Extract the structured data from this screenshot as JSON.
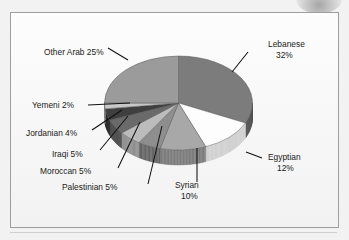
{
  "figure": {
    "frame_border_color": "#9e9e9e",
    "background_color": "#f2f2f2"
  },
  "chart_data": {
    "type": "pie",
    "title": "",
    "xlabel": "",
    "ylabel": "",
    "legend_position": "none",
    "labels_style": "callout-with-leader-lines",
    "three_d": true,
    "start_angle_deg": 0,
    "direction": "clockwise",
    "total_percent": 100,
    "categories": [
      "Lebanese",
      "Egyptian",
      "Syrian",
      "Palestinian",
      "Moroccan",
      "Iraqi",
      "Jordanian",
      "Yemeni",
      "Other Arab"
    ],
    "values": [
      32,
      12,
      10,
      5,
      5,
      5,
      4,
      2,
      25
    ],
    "slices": [
      {
        "name": "Lebanese",
        "value": 32,
        "label": "Lebanese",
        "value_label": "32%",
        "color": "#7c7c7c",
        "side_color": "#565656"
      },
      {
        "name": "Egyptian",
        "value": 12,
        "label": "Egyptian",
        "value_label": "12%",
        "color": "#fdfdfd",
        "side_color": "#d2d2d2"
      },
      {
        "name": "Syrian",
        "value": 10,
        "label": "Syrian",
        "value_label": "10%",
        "color": "#a8a8a8",
        "side_color": "#7e7e7e"
      },
      {
        "name": "Palestinian",
        "value": 5,
        "label": "Palestinian",
        "value_label": "5%",
        "color": "#8e8e8e",
        "side_color": "#686868"
      },
      {
        "name": "Moroccan",
        "value": 5,
        "label": "Moroccan",
        "value_label": "5%",
        "color": "#bcbcbc",
        "side_color": "#909090"
      },
      {
        "name": "Iraqi",
        "value": 5,
        "label": "Iraqi",
        "value_label": "5%",
        "color": "#6a6a6a",
        "side_color": "#4a4a4a"
      },
      {
        "name": "Jordanian",
        "value": 4,
        "label": "Jordanian",
        "value_label": "4%",
        "color": "#3f3f3f",
        "side_color": "#2b2b2b"
      },
      {
        "name": "Yemeni",
        "value": 2,
        "label": "Yemeni",
        "value_label": "2%",
        "color": "#c8c8c8",
        "side_color": "#9c9c9c"
      },
      {
        "name": "Other Arab",
        "value": 25,
        "label": "Other Arab",
        "value_label": "25%",
        "color": "#9b9b9b",
        "side_color": "#747474"
      }
    ],
    "annotations": [
      {
        "text": "Lebanese",
        "value_text": "32%"
      },
      {
        "text": "Egyptian",
        "value_text": "12%"
      },
      {
        "text": "Syrian",
        "value_text": "10%"
      },
      {
        "text": "Palestinian 5%",
        "value_text": ""
      },
      {
        "text": "Moroccan 5%",
        "value_text": ""
      },
      {
        "text": "Iraqi 5%",
        "value_text": ""
      },
      {
        "text": "Jordanian 4%",
        "value_text": ""
      },
      {
        "text": "Yemeni 2%",
        "value_text": ""
      },
      {
        "text": "Other Arab 25%",
        "value_text": ""
      }
    ]
  },
  "labels": {
    "lebanese_name": "Lebanese",
    "lebanese_value": "32%",
    "egyptian_name": "Egyptian",
    "egyptian_value": "12%",
    "syrian_name": "Syrian",
    "syrian_value": "10%",
    "palestinian": "Palestinian 5%",
    "moroccan": "Moroccan 5%",
    "iraqi": "Iraqi 5%",
    "jordanian": "Jordanian 4%",
    "yemeni": "Yemeni 2%",
    "other_arab": "Other Arab 25%"
  }
}
